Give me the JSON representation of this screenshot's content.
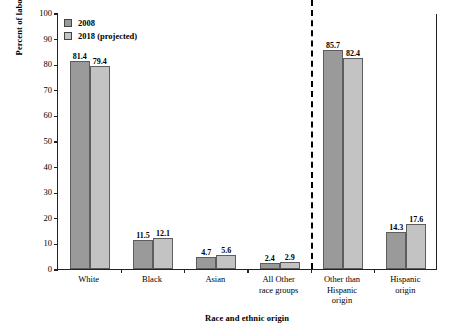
{
  "chart_data": {
    "type": "bar",
    "title": "",
    "xlabel": "Race and ethnic origin",
    "ylabel": "Percent of labor force",
    "ylim": [
      0,
      100
    ],
    "yticks": [
      0,
      10,
      20,
      30,
      40,
      50,
      60,
      70,
      80,
      90,
      100
    ],
    "grid": false,
    "legend_position": "top-left",
    "categories": [
      "White",
      "Black",
      "Asian",
      "All Other race groups",
      "Other than Hispanic origin",
      "Hispanic origin"
    ],
    "category_lines": [
      [
        "White"
      ],
      [
        "Black"
      ],
      [
        "Asian"
      ],
      [
        "All Other",
        "race groups"
      ],
      [
        "Other than",
        "Hispanic",
        "origin"
      ],
      [
        "Hispanic",
        "origin"
      ]
    ],
    "series": [
      {
        "name": "2008",
        "color": "#9a9a9a",
        "values": [
          81.4,
          11.5,
          4.7,
          2.4,
          85.7,
          14.3
        ]
      },
      {
        "name": "2018 (projected)",
        "color": "#c3c3c3",
        "values": [
          79.4,
          12.1,
          5.6,
          2.9,
          82.4,
          17.6
        ]
      }
    ],
    "annotations": [
      {
        "type": "vertical-dashed-divider",
        "after_category": "All Other race groups"
      }
    ]
  },
  "legend": {
    "items": [
      {
        "label": "2008"
      },
      {
        "label": "2018 (projected)"
      }
    ]
  },
  "axes": {
    "y_title": "Percent of labor force",
    "x_title": "Race and ethnic origin"
  }
}
